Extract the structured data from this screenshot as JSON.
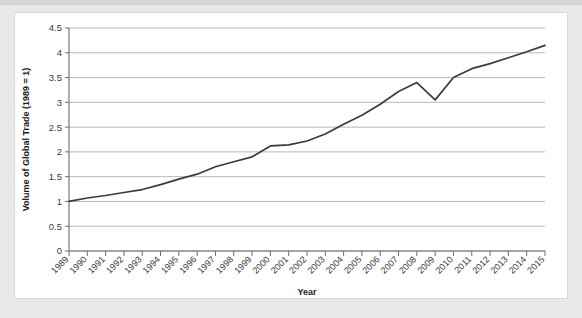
{
  "chart_data": {
    "type": "line",
    "title": "",
    "xlabel": "Year",
    "ylabel": "Volume of Global Trade (1989 = 1)",
    "ylim": [
      0,
      4.5
    ],
    "y_ticks": [
      "0",
      "0.5",
      "1",
      "1.5",
      "2",
      "2.5",
      "3",
      "3.5",
      "4",
      "4.5"
    ],
    "y_tick_values": [
      0,
      0.5,
      1,
      1.5,
      2,
      2.5,
      3,
      3.5,
      4,
      4.5
    ],
    "grid": "horizontal",
    "legend": "none",
    "line_color": "#3b3b3b",
    "categories": [
      "1989",
      "1990",
      "1991",
      "1992",
      "1993",
      "1994",
      "1995",
      "1996",
      "1997",
      "1998",
      "1999",
      "2000",
      "2001",
      "2002",
      "2003",
      "2004",
      "2005",
      "2006",
      "2007",
      "2008",
      "2009",
      "2010",
      "2011",
      "2012",
      "2013",
      "2014",
      "2015"
    ],
    "series": [
      {
        "name": "Volume of Global Trade",
        "values": [
          1.0,
          1.07,
          1.12,
          1.18,
          1.24,
          1.34,
          1.45,
          1.55,
          1.7,
          1.8,
          1.9,
          2.12,
          2.14,
          2.22,
          2.36,
          2.56,
          2.74,
          2.96,
          3.22,
          3.4,
          3.05,
          3.5,
          3.68,
          3.78,
          3.9,
          4.02,
          4.15
        ]
      }
    ]
  },
  "figure": {
    "background_color": "#e9e9e9",
    "card_color": "#ffffff"
  }
}
